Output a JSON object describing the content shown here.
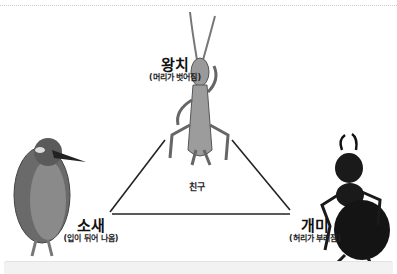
{
  "diagram": {
    "type": "triangle-relationship",
    "center_label": "친구",
    "nodes": [
      {
        "id": "grasshopper",
        "name": "왕치",
        "note": "(머리가 벗어짐)",
        "position": "top"
      },
      {
        "id": "kingfisher",
        "name": "소새",
        "note": "(입이 뒤어 나옴)",
        "position": "bottom-left"
      },
      {
        "id": "ant",
        "name": "개미",
        "note": "(허리가 부러짐)",
        "position": "bottom-right"
      }
    ],
    "edges": [
      {
        "from": "grasshopper",
        "to": "kingfisher"
      },
      {
        "from": "grasshopper",
        "to": "ant"
      },
      {
        "from": "kingfisher",
        "to": "ant"
      }
    ]
  },
  "colors": {
    "line": "#222222",
    "grasshopper": "#8a8a8a",
    "kingfisher": "#5a5a5a",
    "ant": "#1a1a1a"
  }
}
